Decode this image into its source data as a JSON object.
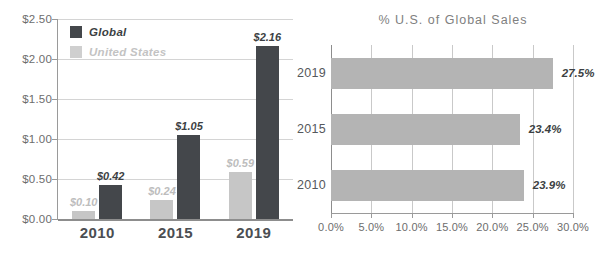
{
  "chart_data": [
    {
      "id": "global-vs-us-sales",
      "type": "bar",
      "orientation": "vertical",
      "title": "",
      "xlabel": "",
      "ylabel": "",
      "categories": [
        "2010",
        "2015",
        "2019"
      ],
      "series": [
        {
          "name": "United States",
          "color": "#c6c6c6",
          "values": [
            0.1,
            0.24,
            0.59
          ],
          "labels": [
            "$0.10",
            "$0.24",
            "$0.59"
          ]
        },
        {
          "name": "Global",
          "color": "#44474b",
          "values": [
            0.42,
            1.05,
            2.16
          ],
          "labels": [
            "$0.42",
            "$1.05",
            "$2.16"
          ]
        }
      ],
      "ylim": [
        0.0,
        2.5
      ],
      "ytick_values": [
        2.5,
        2.0,
        1.5,
        1.0,
        0.5,
        0.0
      ],
      "ytick_labels": [
        "$2.50",
        "$2.00",
        "$1.50",
        "$1.00",
        "$0.50",
        "$0.00"
      ],
      "grid": true,
      "legend_position": "top-left",
      "legend": [
        {
          "label": "Global",
          "color": "#44474b"
        },
        {
          "label": "United States",
          "color": "#cfcfcf"
        }
      ]
    },
    {
      "id": "pct-us-of-global-sales",
      "type": "bar",
      "orientation": "horizontal",
      "title": "% U.S. of Global Sales",
      "xlabel": "",
      "ylabel": "",
      "categories": [
        "2019",
        "2015",
        "2010"
      ],
      "values": [
        27.5,
        23.4,
        23.9
      ],
      "value_labels": [
        "27.5%",
        "23.4%",
        "23.9%"
      ],
      "bar_color": "#b4b4b4",
      "xlim": [
        0.0,
        30.0
      ],
      "xtick_values": [
        0.0,
        5.0,
        10.0,
        15.0,
        20.0,
        25.0,
        30.0
      ],
      "xtick_labels": [
        "0.0%",
        "5.0%",
        "10.0%",
        "15.0%",
        "20.0%",
        "25.0%",
        "30.0%"
      ],
      "grid": true,
      "legend_position": "none"
    }
  ],
  "colors": {
    "global": "#44474b",
    "united_states": "#c6c6c6",
    "percent_bar": "#b4b4b4",
    "gridline": "#d4d4d4",
    "axis": "#8d8d8d",
    "tick_text": "#6d6d6d",
    "category_text": "#4b4e52",
    "title_text": "#808080"
  }
}
